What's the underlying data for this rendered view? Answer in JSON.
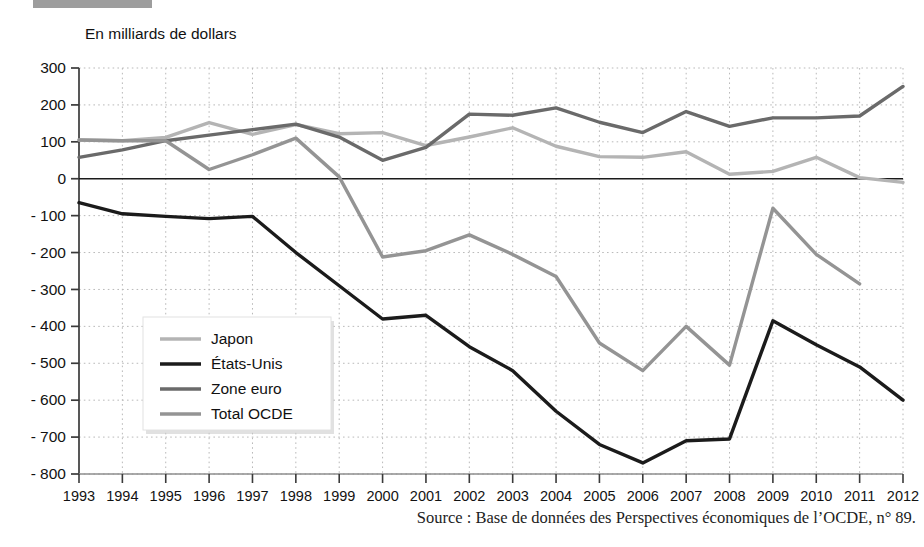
{
  "header": {
    "badge_label": "DOCUMENT 2",
    "title": "Solde de la balance courante"
  },
  "chart_data": {
    "type": "line",
    "title": "Solde de la balance courante",
    "subtitle": "En milliards de dollars",
    "unit_label": "En milliards de dollars",
    "xlabel": "",
    "ylabel": "En milliards de dollars",
    "ylim": [
      -800,
      300
    ],
    "ytick_step": 100,
    "grid": true,
    "legend_position": "inside-left-lower",
    "categories": [
      1993,
      1994,
      1995,
      1996,
      1997,
      1998,
      1999,
      2000,
      2001,
      2002,
      2003,
      2004,
      2005,
      2006,
      2007,
      2008,
      2009,
      2010,
      2011,
      2012
    ],
    "yticks": [
      300,
      200,
      100,
      0,
      -100,
      -200,
      -300,
      -400,
      -500,
      -600,
      -700,
      -800
    ],
    "ytick_labels": [
      "300",
      "200",
      "100",
      "0",
      "- 100",
      "- 200",
      "- 300",
      "- 400",
      "- 500",
      "- 600",
      "- 700",
      "- 800"
    ],
    "xtick_labels": [
      "1993",
      "1994",
      "1995",
      "1996",
      "1997",
      "1998",
      "1999",
      "2000",
      "2001",
      "2002",
      "2003",
      "2004",
      "2005",
      "2006",
      "2007",
      "2008",
      "2009",
      "2010",
      "2011",
      "2012"
    ],
    "series": [
      {
        "name": "Japon",
        "color": "#b4b4b4",
        "values": [
          105,
          103,
          112,
          152,
          120,
          147,
          122,
          125,
          90,
          113,
          138,
          88,
          60,
          58,
          73,
          12,
          20,
          58,
          3,
          -10
        ]
      },
      {
        "name": "États-Unis",
        "color": "#1b1b1b",
        "values": [
          -65,
          -95,
          -102,
          -108,
          -102,
          -200,
          -290,
          -380,
          -370,
          -455,
          -520,
          -630,
          -720,
          -770,
          -710,
          -705,
          -385,
          -450,
          -510,
          -600
        ]
      },
      {
        "name": "Zone euro",
        "color": "#6a6a6a",
        "values": [
          58,
          78,
          103,
          118,
          133,
          148,
          113,
          50,
          85,
          175,
          172,
          192,
          153,
          125,
          182,
          142,
          165,
          165,
          170,
          250
        ]
      },
      {
        "name": "Total OCDE",
        "color": "#949494",
        "values": [
          105,
          103,
          103,
          25,
          65,
          110,
          5,
          -212,
          -195,
          -152,
          -205,
          -265,
          -445,
          -520,
          -400,
          -505,
          -80,
          -205,
          -285,
          null
        ]
      }
    ]
  },
  "source": {
    "text": "Source : Base de données des Perspectives économiques de l’OCDE, n° 89."
  }
}
